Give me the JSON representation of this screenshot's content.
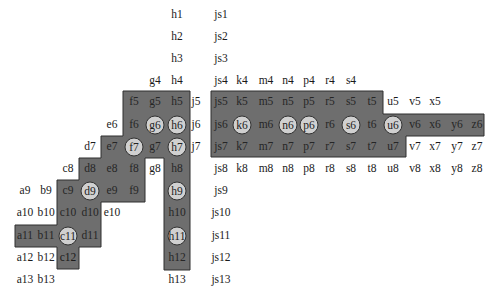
{
  "diagram": {
    "fill_color": "#6e6e6e",
    "circle_color": "#d0d0d0",
    "columns": {
      "a": 25,
      "b": 46,
      "c": 68,
      "d": 90,
      "e": 112,
      "f": 134,
      "g": 155,
      "h": 177,
      "j": 196,
      "js": 221,
      "k": 242,
      "m": 266,
      "n": 288,
      "p": 309,
      "r": 330,
      "s": 351,
      "t": 372,
      "u": 393,
      "v": 415,
      "x": 435,
      "y": 457,
      "z": 477
    },
    "rows": {
      "1": 15,
      "2": 37,
      "3": 59,
      "4": 81,
      "5": 102,
      "6": 125,
      "7": 147,
      "8": 169,
      "9": 191,
      "10": 213,
      "11": 236,
      "12": 258,
      "13": 280
    },
    "labels": [
      {
        "t": "h1",
        "c": "h",
        "r": "1"
      },
      {
        "t": "js1",
        "c": "js",
        "r": "1"
      },
      {
        "t": "h2",
        "c": "h",
        "r": "2"
      },
      {
        "t": "js2",
        "c": "js",
        "r": "2"
      },
      {
        "t": "h3",
        "c": "h",
        "r": "3"
      },
      {
        "t": "js3",
        "c": "js",
        "r": "3"
      },
      {
        "t": "g4",
        "c": "g",
        "r": "4"
      },
      {
        "t": "h4",
        "c": "h",
        "r": "4"
      },
      {
        "t": "js4",
        "c": "js",
        "r": "4"
      },
      {
        "t": "k4",
        "c": "k",
        "r": "4"
      },
      {
        "t": "m4",
        "c": "m",
        "r": "4"
      },
      {
        "t": "n4",
        "c": "n",
        "r": "4"
      },
      {
        "t": "p4",
        "c": "p",
        "r": "4"
      },
      {
        "t": "r4",
        "c": "r",
        "r": "4"
      },
      {
        "t": "s4",
        "c": "s",
        "r": "4"
      },
      {
        "t": "f5",
        "c": "f",
        "r": "5",
        "d": 1
      },
      {
        "t": "g5",
        "c": "g",
        "r": "5",
        "d": 1
      },
      {
        "t": "h5",
        "c": "h",
        "r": "5",
        "d": 1
      },
      {
        "t": "j5",
        "c": "j",
        "r": "5"
      },
      {
        "t": "js5",
        "c": "js",
        "r": "5",
        "d": 1
      },
      {
        "t": "k5",
        "c": "k",
        "r": "5",
        "d": 1
      },
      {
        "t": "m5",
        "c": "m",
        "r": "5",
        "d": 1
      },
      {
        "t": "n5",
        "c": "n",
        "r": "5",
        "d": 1
      },
      {
        "t": "p5",
        "c": "p",
        "r": "5",
        "d": 1
      },
      {
        "t": "r5",
        "c": "r",
        "r": "5",
        "d": 1
      },
      {
        "t": "s5",
        "c": "s",
        "r": "5",
        "d": 1
      },
      {
        "t": "t5",
        "c": "t",
        "r": "5",
        "d": 1
      },
      {
        "t": "u5",
        "c": "u",
        "r": "5"
      },
      {
        "t": "v5",
        "c": "v",
        "r": "5"
      },
      {
        "t": "x5",
        "c": "x",
        "r": "5"
      },
      {
        "t": "e6",
        "c": "e",
        "r": "6"
      },
      {
        "t": "f6",
        "c": "f",
        "r": "6",
        "d": 1
      },
      {
        "t": "g6",
        "c": "g",
        "r": "6",
        "o": 1
      },
      {
        "t": "h6",
        "c": "h",
        "r": "6",
        "o": 1
      },
      {
        "t": "j6",
        "c": "j",
        "r": "6"
      },
      {
        "t": "js6",
        "c": "js",
        "r": "6",
        "d": 1
      },
      {
        "t": "k6",
        "c": "k",
        "r": "6",
        "o": 1
      },
      {
        "t": "m6",
        "c": "m",
        "r": "6",
        "d": 1
      },
      {
        "t": "n6",
        "c": "n",
        "r": "6",
        "o": 1
      },
      {
        "t": "p6",
        "c": "p",
        "r": "6",
        "o": 1
      },
      {
        "t": "r6",
        "c": "r",
        "r": "6",
        "d": 1
      },
      {
        "t": "s6",
        "c": "s",
        "r": "6",
        "o": 1
      },
      {
        "t": "t6",
        "c": "t",
        "r": "6",
        "d": 1
      },
      {
        "t": "u6",
        "c": "u",
        "r": "6",
        "o": 1
      },
      {
        "t": "v6",
        "c": "v",
        "r": "6",
        "d": 1
      },
      {
        "t": "x6",
        "c": "x",
        "r": "6",
        "d": 1
      },
      {
        "t": "y6",
        "c": "y",
        "r": "6",
        "d": 1
      },
      {
        "t": "z6",
        "c": "z",
        "r": "6",
        "d": 1
      },
      {
        "t": "d7",
        "c": "d",
        "r": "7"
      },
      {
        "t": "e7",
        "c": "e",
        "r": "7",
        "d": 1
      },
      {
        "t": "f7",
        "c": "f",
        "r": "7",
        "o": 1
      },
      {
        "t": "g7",
        "c": "g",
        "r": "7",
        "d": 1
      },
      {
        "t": "h7",
        "c": "h",
        "r": "7",
        "o": 1
      },
      {
        "t": "j7",
        "c": "j",
        "r": "7"
      },
      {
        "t": "js7",
        "c": "js",
        "r": "7",
        "d": 1
      },
      {
        "t": "k7",
        "c": "k",
        "r": "7",
        "d": 1
      },
      {
        "t": "m7",
        "c": "m",
        "r": "7",
        "d": 1
      },
      {
        "t": "n7",
        "c": "n",
        "r": "7",
        "d": 1
      },
      {
        "t": "p7",
        "c": "p",
        "r": "7",
        "d": 1
      },
      {
        "t": "r7",
        "c": "r",
        "r": "7",
        "d": 1
      },
      {
        "t": "s7",
        "c": "s",
        "r": "7",
        "d": 1
      },
      {
        "t": "t7",
        "c": "t",
        "r": "7",
        "d": 1
      },
      {
        "t": "u7",
        "c": "u",
        "r": "7",
        "d": 1
      },
      {
        "t": "v7",
        "c": "v",
        "r": "7"
      },
      {
        "t": "x7",
        "c": "x",
        "r": "7"
      },
      {
        "t": "y7",
        "c": "y",
        "r": "7"
      },
      {
        "t": "z7",
        "c": "z",
        "r": "7"
      },
      {
        "t": "c8",
        "c": "c",
        "r": "8"
      },
      {
        "t": "d8",
        "c": "d",
        "r": "8",
        "d": 1
      },
      {
        "t": "e8",
        "c": "e",
        "r": "8",
        "d": 1
      },
      {
        "t": "f8",
        "c": "f",
        "r": "8",
        "d": 1
      },
      {
        "t": "g8",
        "c": "g",
        "r": "8"
      },
      {
        "t": "h8",
        "c": "h",
        "r": "8",
        "d": 1
      },
      {
        "t": "js8",
        "c": "js",
        "r": "8"
      },
      {
        "t": "k8",
        "c": "k",
        "r": "8"
      },
      {
        "t": "m8",
        "c": "m",
        "r": "8"
      },
      {
        "t": "n8",
        "c": "n",
        "r": "8"
      },
      {
        "t": "p8",
        "c": "p",
        "r": "8"
      },
      {
        "t": "r8",
        "c": "r",
        "r": "8"
      },
      {
        "t": "s8",
        "c": "s",
        "r": "8"
      },
      {
        "t": "t8",
        "c": "t",
        "r": "8"
      },
      {
        "t": "u8",
        "c": "u",
        "r": "8"
      },
      {
        "t": "v8",
        "c": "v",
        "r": "8"
      },
      {
        "t": "x8",
        "c": "x",
        "r": "8"
      },
      {
        "t": "y8",
        "c": "y",
        "r": "8"
      },
      {
        "t": "z8",
        "c": "z",
        "r": "8"
      },
      {
        "t": "a9",
        "c": "a",
        "r": "9"
      },
      {
        "t": "b9",
        "c": "b",
        "r": "9"
      },
      {
        "t": "c9",
        "c": "c",
        "r": "9",
        "d": 1
      },
      {
        "t": "d9",
        "c": "d",
        "r": "9",
        "o": 1
      },
      {
        "t": "e9",
        "c": "e",
        "r": "9",
        "d": 1
      },
      {
        "t": "f9",
        "c": "f",
        "r": "9",
        "d": 1
      },
      {
        "t": "h9",
        "c": "h",
        "r": "9",
        "o": 1
      },
      {
        "t": "js9",
        "c": "js",
        "r": "9"
      },
      {
        "t": "a10",
        "c": "a",
        "r": "10"
      },
      {
        "t": "b10",
        "c": "b",
        "r": "10"
      },
      {
        "t": "c10",
        "c": "c",
        "r": "10",
        "d": 1
      },
      {
        "t": "d10",
        "c": "d",
        "r": "10",
        "d": 1
      },
      {
        "t": "e10",
        "c": "e",
        "r": "10"
      },
      {
        "t": "h10",
        "c": "h",
        "r": "10",
        "d": 1
      },
      {
        "t": "js10",
        "c": "js",
        "r": "10"
      },
      {
        "t": "a11",
        "c": "a",
        "r": "11",
        "d": 1
      },
      {
        "t": "b11",
        "c": "b",
        "r": "11",
        "d": 1
      },
      {
        "t": "c11",
        "c": "c",
        "r": "11",
        "o": 1
      },
      {
        "t": "d11",
        "c": "d",
        "r": "11",
        "d": 1
      },
      {
        "t": "h11",
        "c": "h",
        "r": "11",
        "o": 1
      },
      {
        "t": "js11",
        "c": "js",
        "r": "11"
      },
      {
        "t": "a12",
        "c": "a",
        "r": "12"
      },
      {
        "t": "b12",
        "c": "b",
        "r": "12",
        "d": 1
      },
      {
        "t": "c12",
        "c": "c",
        "r": "12"
      },
      {
        "t": "h12",
        "c": "h",
        "r": "12",
        "d": 1
      },
      {
        "t": "js12",
        "c": "js",
        "r": "12"
      },
      {
        "t": "a13",
        "c": "a",
        "r": "13"
      },
      {
        "t": "b13",
        "c": "b",
        "r": "13"
      },
      {
        "t": "h13",
        "c": "h",
        "r": "13"
      },
      {
        "t": "js13",
        "c": "js",
        "r": "13"
      }
    ],
    "regions": [
      {
        "name": "left-staircase-region",
        "points": "123,91 190,91 190,270 164,270 164,158 145,158 145,202 101,202 101,225 101,247 79,247 79,269 57,269 57,247 15,247 15,225 57,225 57,180 79,180 79,158 101,158 101,136 123,136"
      },
      {
        "name": "right-band-region",
        "points": "211,91 383,91 383,114 484,114 484,136 406,136 406,157 211,157"
      }
    ]
  }
}
